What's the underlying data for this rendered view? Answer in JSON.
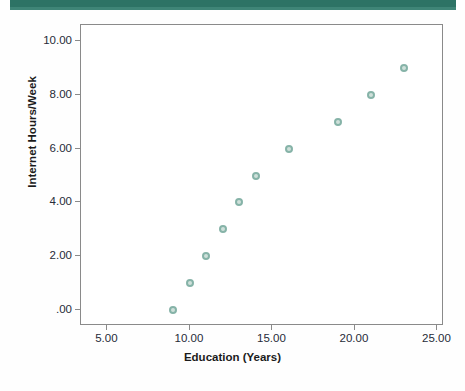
{
  "decor": {
    "top_band_color": "#2d7365"
  },
  "chart_data": {
    "type": "scatter",
    "title": "",
    "xlabel": "Education (Years)",
    "ylabel": "Internet Hours/Week",
    "xlim": [
      3.4,
      25.4
    ],
    "ylim": [
      -0.6,
      10.6
    ],
    "grid": false,
    "legend": null,
    "marker_color": "#86b3a8",
    "marker_fill": "#cfe0da",
    "xticks": [
      5,
      10,
      15,
      20,
      25
    ],
    "xtick_labels": [
      "5.00",
      "10.00",
      "15.00",
      "20.00",
      "25.00"
    ],
    "yticks": [
      0,
      2,
      4,
      6,
      8,
      10
    ],
    "ytick_labels": [
      ".00",
      "2.00",
      "4.00",
      "6.00",
      "8.00",
      "10.00"
    ],
    "x": [
      9,
      10,
      11,
      12,
      13,
      14,
      16,
      19,
      21,
      23
    ],
    "y": [
      0,
      1,
      2,
      3,
      4,
      5,
      6,
      7,
      8,
      9
    ],
    "points": [
      {
        "x": 9,
        "y": 0
      },
      {
        "x": 10,
        "y": 1
      },
      {
        "x": 11,
        "y": 2
      },
      {
        "x": 12,
        "y": 3
      },
      {
        "x": 13,
        "y": 4
      },
      {
        "x": 14,
        "y": 5
      },
      {
        "x": 16,
        "y": 6
      },
      {
        "x": 19,
        "y": 7
      },
      {
        "x": 21,
        "y": 8
      },
      {
        "x": 23,
        "y": 9
      }
    ]
  }
}
